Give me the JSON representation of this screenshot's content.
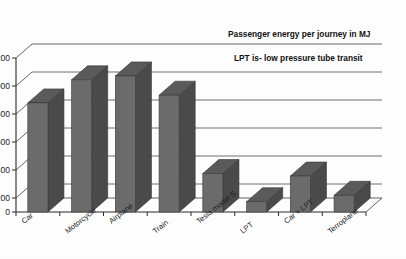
{
  "chart_data": {
    "type": "bar",
    "title": "",
    "xlabel": "",
    "ylabel": "",
    "ylim": [
      0,
      1200
    ],
    "yticks": [
      0,
      200,
      400,
      600,
      800,
      1000,
      1200
    ],
    "grid": true,
    "legend": "none",
    "style": "3d-column",
    "categories": [
      "Car",
      "Motorcycle",
      "Airplane",
      "Train",
      "Tesla model S",
      "LPT",
      "Car + LPT",
      "Terroplane"
    ],
    "values": [
      850,
      1030,
      1060,
      910,
      300,
      80,
      280,
      130
    ],
    "annotations": [
      "Passenger energy per journey in MJ",
      "LPT is- low pressure tube transit"
    ],
    "units": "MJ"
  },
  "axis": {
    "y_tick_labels": [
      "1200",
      "1000",
      "800",
      "600",
      "400",
      "200",
      "0"
    ]
  },
  "colors": {
    "bar_front": "#6b6b6b",
    "bar_side": "#4a4a4a",
    "bar_top": "#5a5a5a",
    "grid": "#4a4a4a",
    "axis": "#2b2b2b",
    "text": "#1d1d1d",
    "background": "#fdfdfd"
  }
}
